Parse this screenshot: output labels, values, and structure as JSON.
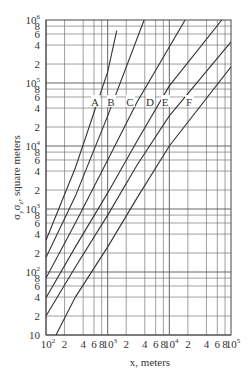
{
  "chart_data": {
    "type": "line",
    "title": "",
    "xlabel": "x, meters",
    "ylabel": "σyσz, square meters",
    "xscale": "log",
    "yscale": "log",
    "xlim": [
      100,
      100000
    ],
    "ylim": [
      10,
      1000000
    ],
    "grid": true,
    "legend_position": "inline labels at y≈6×10^4",
    "x_tick_labels": [
      "10^2",
      "2",
      "4",
      "6",
      "8",
      "10^3",
      "2",
      "4",
      "6",
      "8",
      "10^4",
      "2",
      "4",
      "6",
      "8",
      "10^5"
    ],
    "y_tick_labels": [
      "10",
      "2",
      "4",
      "6",
      "8",
      "10^2",
      "2",
      "4",
      "6",
      "8",
      "10^3",
      "2",
      "4",
      "6",
      "8",
      "10^4",
      "2",
      "4",
      "6",
      "8",
      "10^5",
      "2",
      "4",
      "6",
      "8",
      "10^6"
    ],
    "series": [
      {
        "name": "A",
        "x": [
          100,
          300,
          1000,
          1400
        ],
        "y": [
          320,
          4500,
          150000,
          680000
        ]
      },
      {
        "name": "B",
        "x": [
          100,
          300,
          1000,
          3900
        ],
        "y": [
          170,
          1600,
          30000,
          1000000
        ]
      },
      {
        "name": "C",
        "x": [
          100,
          300,
          1000,
          3000,
          18000
        ],
        "y": [
          80,
          600,
          6000,
          50000,
          1000000
        ]
      },
      {
        "name": "D",
        "x": [
          100,
          300,
          1000,
          3000,
          10000,
          71000
        ],
        "y": [
          39,
          250,
          1800,
          12000,
          90000,
          1000000
        ]
      },
      {
        "name": "E",
        "x": [
          100,
          300,
          1000,
          3000,
          10000,
          100000
        ],
        "y": [
          20,
          120,
          800,
          5000,
          30000,
          450000
        ]
      },
      {
        "name": "F",
        "x": [
          145,
          300,
          1000,
          3000,
          10000,
          100000
        ],
        "y": [
          10,
          40,
          250,
          1500,
          10000,
          180000
        ]
      }
    ]
  },
  "axes": {
    "xlabel": "x, meters",
    "ylabel_main": "σ",
    "ylabel_sub1": "y",
    "ylabel_mid": "σ",
    "ylabel_sub2": "z",
    "ylabel_rest": ", square meters"
  },
  "curve_labels": [
    "A",
    "B",
    "C",
    "D",
    "E",
    "F"
  ]
}
